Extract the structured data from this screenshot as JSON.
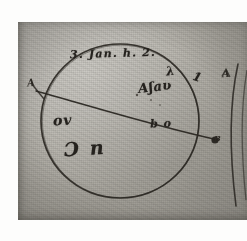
{
  "document": {
    "kind": "manuscript-astronomical-sketch",
    "medium": "ink on paper, photographic plate reproduction"
  },
  "annotations": {
    "date_line": "3. Jan. h. 2.",
    "star_cluster": "Aʃaʋ",
    "lambda_mark": "λ",
    "tick_mark_right": "1",
    "chord_label": "b o",
    "lower_left_note": "ov",
    "lower_note": "Ɔ n",
    "endpoint_left": "A",
    "endpoint_right": "B",
    "far_right_label": "A"
  },
  "figure": {
    "circle": {
      "name": "solar-disk",
      "center_x": 120,
      "center_y": 121,
      "radius": 78
    },
    "chord": {
      "name": "diameter-line",
      "x1": 38,
      "y1": 92,
      "x2": 216,
      "y2": 139
    },
    "markers": [
      {
        "name": "node-b",
        "x": 215,
        "y": 140
      }
    ],
    "right_arc": {
      "name": "adjacent-disk-arc",
      "x": 233,
      "y_top": 68,
      "y_bottom": 200
    }
  },
  "colors": {
    "ink": "#2b2823",
    "plate": "#b2afa7",
    "paper": "#fdfdfc"
  }
}
